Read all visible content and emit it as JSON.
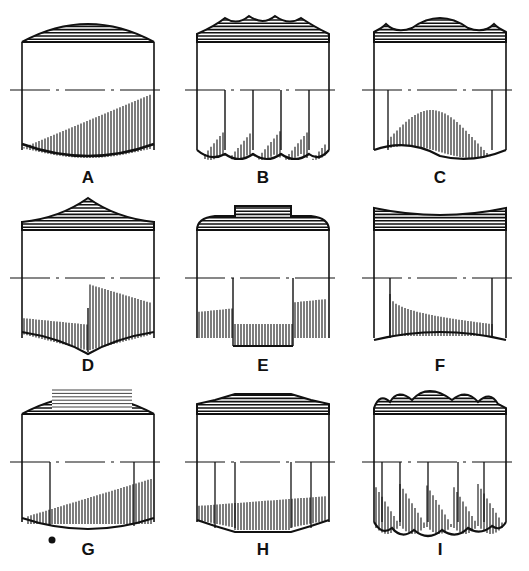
{
  "diagram": {
    "title": "",
    "figures": [
      {
        "label": "A",
        "top_profile": "convex-dome",
        "bottom_profile": "convex"
      },
      {
        "label": "B",
        "top_profile": "scalloped-points",
        "bottom_profile": "scalloped-points"
      },
      {
        "label": "C",
        "top_profile": "central-bulge-with-small-horns",
        "bottom_profile": "wave"
      },
      {
        "label": "D",
        "top_profile": "pointed-peak",
        "bottom_profile": "pointed"
      },
      {
        "label": "E",
        "top_profile": "stepped-flat-boss",
        "bottom_profile": "stepped-notch"
      },
      {
        "label": "F",
        "top_profile": "concave-hollow",
        "bottom_profile": "concave"
      },
      {
        "label": "G",
        "top_profile": "flat-center-with-rounded-edges",
        "bottom_profile": "convex",
        "mark": "small-glyph"
      },
      {
        "label": "H",
        "top_profile": "stepped-facets",
        "bottom_profile": "faceted"
      },
      {
        "label": "I",
        "top_profile": "five-beads",
        "bottom_profile": "five-beads"
      }
    ]
  }
}
